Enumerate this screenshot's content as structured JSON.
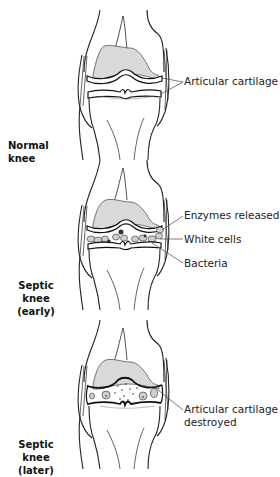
{
  "figure": {
    "panels": [
      {
        "id": "normal",
        "stage_label": [
          "Normal knee"
        ],
        "callouts": [
          "Articular cartilage"
        ]
      },
      {
        "id": "septic-early",
        "stage_label": [
          "Septic knee",
          "(early)"
        ],
        "callouts": [
          "Enzymes released",
          "White cells",
          "Bacteria"
        ]
      },
      {
        "id": "septic-later",
        "stage_label": [
          "Septic knee",
          "(later)"
        ],
        "callouts": [
          "Articular cartilage",
          "destroyed"
        ]
      }
    ],
    "colors": {
      "line": "#222222",
      "bone_fill": "#ffffff",
      "cartilage_shade": "#d9d9d9",
      "cell_fill": "#cfcfcf",
      "bacteria": "#333333"
    }
  }
}
